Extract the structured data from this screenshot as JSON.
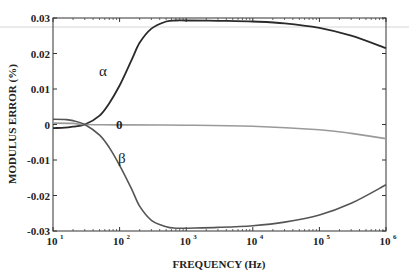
{
  "chart_data": {
    "type": "line",
    "title": "",
    "xlabel": "FREQUENCY (Hz)",
    "ylabel": "MODULUS ERROR (%)",
    "xscale": "log",
    "xlim": [
      10,
      1000000
    ],
    "ylim": [
      -0.03,
      0.03
    ],
    "xticks": [
      10,
      100,
      1000,
      10000,
      100000,
      1000000
    ],
    "xtick_labels": [
      {
        "base": "10",
        "exp": "1"
      },
      {
        "base": "10",
        "exp": "2"
      },
      {
        "base": "10",
        "exp": "3"
      },
      {
        "base": "10",
        "exp": "4"
      },
      {
        "base": "10",
        "exp": "5"
      },
      {
        "base": "10",
        "exp": "6"
      }
    ],
    "yticks": [
      0.03,
      0.02,
      0.01,
      0,
      -0.01,
      -0.02,
      -0.03
    ],
    "ytick_labels": [
      "0.03",
      "0.02",
      "0.01",
      "0",
      "-0.01",
      "-0.02",
      "-0.03"
    ],
    "grid": false,
    "legend": "inline labels",
    "series": [
      {
        "name": "α",
        "color": "#2a2a2a",
        "x": [
          10,
          15,
          20,
          30,
          50,
          70,
          100,
          150,
          200,
          300,
          500,
          700,
          1000,
          3000,
          10000,
          30000,
          100000,
          300000,
          1000000
        ],
        "values": [
          -0.001,
          -0.0009,
          -0.0006,
          0.0,
          0.0025,
          0.006,
          0.011,
          0.018,
          0.023,
          0.027,
          0.029,
          0.0293,
          0.0293,
          0.0292,
          0.029,
          0.0285,
          0.0272,
          0.025,
          0.0215
        ]
      },
      {
        "name": "θ",
        "color": "#9a9a9a",
        "x": [
          10,
          20,
          30,
          100,
          1000,
          10000,
          100000,
          300000,
          1000000
        ],
        "values": [
          0.0004,
          0.0003,
          0.0,
          -0.0001,
          -0.0002,
          -0.0005,
          -0.0015,
          -0.0025,
          -0.004
        ]
      },
      {
        "name": "β",
        "color": "#555555",
        "x": [
          10,
          15,
          20,
          30,
          50,
          70,
          100,
          150,
          200,
          300,
          500,
          700,
          1000,
          3000,
          10000,
          30000,
          100000,
          300000,
          1000000
        ],
        "values": [
          0.0015,
          0.0014,
          0.0011,
          0.0,
          -0.003,
          -0.0065,
          -0.0115,
          -0.018,
          -0.023,
          -0.027,
          -0.0288,
          -0.0292,
          -0.0292,
          -0.029,
          -0.0285,
          -0.0275,
          -0.0255,
          -0.0222,
          -0.017
        ]
      }
    ],
    "annotations": [
      {
        "text": "α",
        "near_x": 70,
        "near_y": 0.02
      },
      {
        "text": "0",
        "near_x": 120,
        "near_y": 0.002
      },
      {
        "text": "β",
        "near_x": 110,
        "near_y": -0.011
      }
    ]
  },
  "labels": {
    "alpha": "α",
    "theta": "0",
    "beta": "β"
  }
}
